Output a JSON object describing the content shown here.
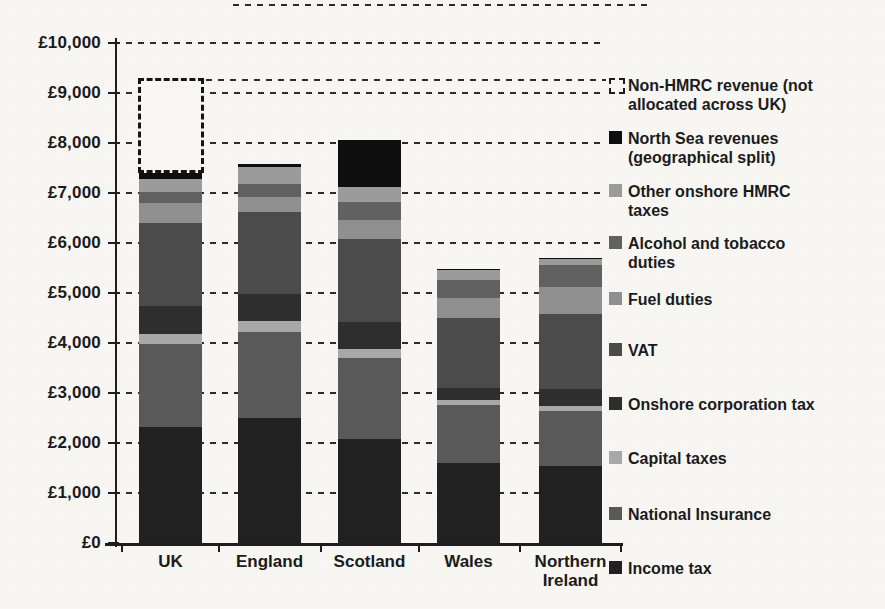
{
  "page": {
    "background_color": "#f7f6f2",
    "ink_color": "#1b1b1b",
    "title": ""
  },
  "chart_data": {
    "type": "bar",
    "stacked": true,
    "title": "",
    "xlabel": "",
    "ylabel": "",
    "ylim": [
      0,
      10000
    ],
    "grid": "dashed-horizontal",
    "legend_position": "right",
    "currency": "£",
    "y_ticks": [
      {
        "value": 10000,
        "label": "£10,000"
      },
      {
        "value": 9000,
        "label": "£9,000"
      },
      {
        "value": 8000,
        "label": "£8,000"
      },
      {
        "value": 7000,
        "label": "£7,000"
      },
      {
        "value": 6000,
        "label": "£6,000"
      },
      {
        "value": 5000,
        "label": "£5,000"
      },
      {
        "value": 4000,
        "label": "£4,000"
      },
      {
        "value": 3000,
        "label": "£3,000"
      },
      {
        "value": 2000,
        "label": "£2,000"
      },
      {
        "value": 1000,
        "label": "£1,000"
      },
      {
        "value": 0,
        "label": "£0"
      }
    ],
    "categories": [
      "UK",
      "England",
      "Scotland",
      "Wales",
      "Northern Ireland"
    ],
    "category_label_lines": [
      [
        "UK"
      ],
      [
        "England"
      ],
      [
        "Scotland"
      ],
      [
        "Wales"
      ],
      [
        "Northern",
        "Ireland"
      ]
    ],
    "series": [
      {
        "name": "Income tax",
        "color": "#212121",
        "values": [
          2320,
          2500,
          2080,
          1600,
          1540
        ]
      },
      {
        "name": "National Insurance",
        "color": "#595959",
        "values": [
          1660,
          1720,
          1630,
          1170,
          1100
        ]
      },
      {
        "name": "Capital taxes",
        "color": "#a8a8a8",
        "values": [
          210,
          230,
          170,
          100,
          100
        ]
      },
      {
        "name": "Onshore corporation tax",
        "color": "#2e2e2e",
        "values": [
          560,
          540,
          540,
          230,
          340
        ]
      },
      {
        "name": "VAT",
        "color": "#4b4b4b",
        "values": [
          1650,
          1630,
          1670,
          1410,
          1500
        ]
      },
      {
        "name": "Fuel duties",
        "color": "#8f8f8f",
        "values": [
          400,
          300,
          380,
          400,
          550
        ]
      },
      {
        "name": "Alcohol and tobacco duties",
        "color": "#616161",
        "values": [
          230,
          270,
          350,
          360,
          430
        ]
      },
      {
        "name": "Other onshore HMRC taxes",
        "color": "#9b9b9b",
        "values": [
          260,
          330,
          300,
          200,
          140
        ]
      },
      {
        "name": "North Sea revenues (geographical split)",
        "color": "#0e0e0e",
        "values": [
          110,
          60,
          950,
          20,
          10
        ]
      }
    ],
    "overlay_series": {
      "name": "Non-HMRC revenue (not allocated across UK)",
      "style": "dashed-outline",
      "values": [
        1900,
        0,
        0,
        0,
        0
      ]
    },
    "totals_solid": [
      7400,
      7580,
      8070,
      5490,
      5720
    ],
    "totals_with_overlay": [
      9300,
      7580,
      8070,
      5490,
      5720
    ]
  },
  "legend": {
    "items": [
      {
        "lines": [
          "Non-HMRC revenue (not",
          "allocated across UK)"
        ],
        "swatch": "dashed-outline",
        "color": "#f7f6f2"
      },
      {
        "lines": [
          "North Sea revenues",
          "(geographical split)"
        ],
        "swatch": "solid",
        "color": "#0e0e0e"
      },
      {
        "lines": [
          "Other onshore HMRC",
          "taxes"
        ],
        "swatch": "solid",
        "color": "#9b9b9b"
      },
      {
        "lines": [
          "Alcohol and tobacco",
          "duties"
        ],
        "swatch": "solid",
        "color": "#616161"
      },
      {
        "lines": [
          "Fuel duties"
        ],
        "swatch": "solid",
        "color": "#8f8f8f"
      },
      {
        "lines": [
          "VAT"
        ],
        "swatch": "solid",
        "color": "#4b4b4b"
      },
      {
        "lines": [
          "Onshore corporation tax"
        ],
        "swatch": "solid",
        "color": "#2e2e2e"
      },
      {
        "lines": [
          "Capital taxes"
        ],
        "swatch": "solid",
        "color": "#a8a8a8"
      },
      {
        "lines": [
          "National Insurance"
        ],
        "swatch": "solid",
        "color": "#595959"
      },
      {
        "lines": [
          "Income tax"
        ],
        "swatch": "solid",
        "color": "#212121"
      }
    ]
  }
}
